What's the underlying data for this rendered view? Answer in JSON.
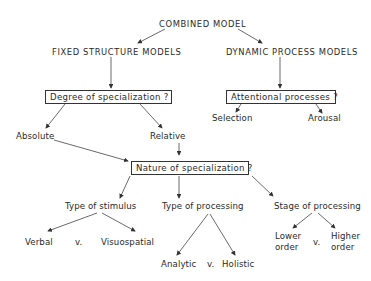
{
  "diagram": {
    "root": "COMBINED MODEL",
    "branches": {
      "fixed": "FIXED STRUCTURE MODELS",
      "dynamic": "DYNAMIC PROCESS MODELS"
    },
    "questions": {
      "degree": "Degree of specialization ?",
      "attention": "Attentional processes ?",
      "nature": "Nature of specialization ?"
    },
    "degree_options": {
      "absolute": "Absolute",
      "relative": "Relative"
    },
    "attention_options": {
      "selection": "Selection",
      "arousal": "Arousal"
    },
    "nature_types": {
      "stimulus": "Type of stimulus",
      "processing": "Type of processing",
      "stage": "Stage of processing"
    },
    "stimulus_options": {
      "left": "Verbal",
      "vs": "v.",
      "right": "Visuospatial"
    },
    "processing_options": {
      "left": "Analytic",
      "vs": "v.",
      "right": "Holistic"
    },
    "stage_options": {
      "left_line1": "Lower",
      "left_line2": "order",
      "vs": "v.",
      "right_line1": "Higher",
      "right_line2": "order"
    }
  }
}
